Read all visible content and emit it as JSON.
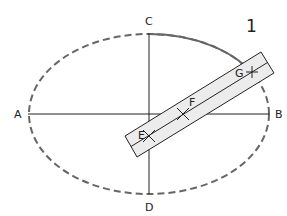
{
  "figure": {
    "number": "1",
    "labels": {
      "A": "A",
      "B": "B",
      "C": "C",
      "D": "D",
      "E": "E",
      "F": "F",
      "G": "G"
    },
    "colors": {
      "ellipse": "#666666",
      "axes": "#222222",
      "strip_fill": "#ececec",
      "strip_stroke": "#222222"
    }
  }
}
